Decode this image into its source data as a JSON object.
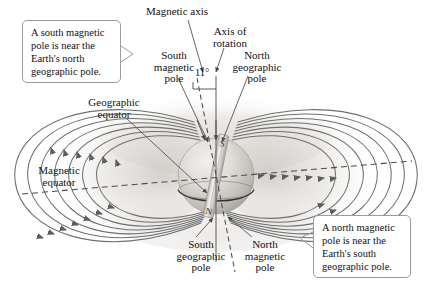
{
  "figure": {
    "background_color": "#ffffff",
    "line_color": "#6b6b6b",
    "text_color": "#111111",
    "callout_border_color": "#9b9b9b"
  },
  "callouts": [
    {
      "id": "left",
      "text": "A south magnetic pole is near the Earth's north geographic pole."
    },
    {
      "id": "right",
      "text": "A north magnetic pole is near the Earth's south geographic pole."
    }
  ],
  "labels": {
    "magnetic_axis": "Magnetic axis",
    "axis_of_rotation": "Axis of\nrotation",
    "north_geographic_pole": "North\ngeographic\npole",
    "south_magnetic_pole": "South\nmagnetic\npole",
    "tilt_angle": "11°",
    "geographic_equator": "Geographic\nequator",
    "magnetic_equator": "Magnetic\nequator",
    "south_geographic_pole": "South\ngeographic\npole",
    "north_magnetic_pole": "North\nmagnetic\npole"
  },
  "diagram": {
    "earth": {
      "center_x": 216,
      "center_y": 176,
      "radius": 38,
      "bar_magnet_north_label": "N",
      "bar_magnet_south_label": "S"
    },
    "tilt_degrees": 11,
    "field_line_count": 8,
    "equator_style": "dashed",
    "geographic_equator_style": "solid"
  }
}
